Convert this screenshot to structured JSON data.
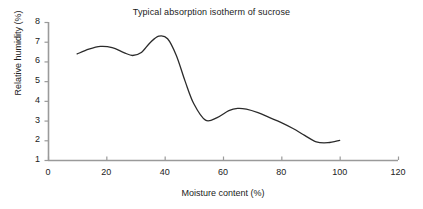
{
  "chart_data": {
    "type": "line",
    "title": "Typical absorption isotherm of sucrose",
    "xlabel": "Moisture content (%)",
    "ylabel": "Relative humidity (%)",
    "xlim": [
      0,
      120
    ],
    "ylim": [
      1,
      8
    ],
    "xticks": [
      0,
      20,
      40,
      60,
      80,
      100,
      120
    ],
    "yticks": [
      1,
      2,
      3,
      4,
      5,
      6,
      7,
      8
    ],
    "xtick_labels": [
      "0",
      "20",
      "40",
      "60",
      "80",
      "100",
      "120"
    ],
    "ytick_labels": [
      "1",
      "2",
      "3",
      "4",
      "5",
      "6",
      "7",
      "8"
    ],
    "grid": false,
    "legend": null,
    "series": [
      {
        "name": "Sucrose absorption isotherm",
        "color": "#2b2b2b",
        "line_width": 1.3,
        "x": [
          10,
          14,
          18,
          22,
          26,
          29,
          32,
          35,
          38,
          41,
          44,
          47,
          50,
          54,
          58,
          62,
          65,
          68,
          72,
          76,
          80,
          84,
          88,
          92,
          96,
          100
        ],
        "y": [
          6.38,
          6.62,
          6.76,
          6.7,
          6.45,
          6.3,
          6.45,
          6.95,
          7.28,
          7.15,
          6.3,
          5.0,
          3.85,
          3.02,
          3.15,
          3.5,
          3.62,
          3.58,
          3.4,
          3.15,
          2.9,
          2.6,
          2.25,
          1.92,
          1.88,
          2.0
        ]
      }
    ],
    "annotations": [],
    "axis_color": "#9a9a9a",
    "text_color": "#222222",
    "background": "#ffffff"
  },
  "figure": {
    "title": "Typical absorption isotherm of sucrose",
    "x_axis_title": "Moisture content (%)",
    "y_axis_title": "Relative humidity (%)"
  }
}
